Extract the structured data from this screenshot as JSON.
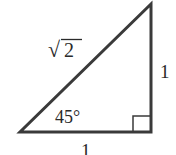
{
  "diagram": {
    "type": "right-triangle",
    "stroke_color": "#3a3a3a",
    "vertices": {
      "left": [
        20,
        132
      ],
      "right_angle": [
        151,
        132
      ],
      "top": [
        151,
        4
      ]
    },
    "labels": {
      "hypotenuse": "2",
      "hypotenuse_radical": "√",
      "vertical_leg": "1",
      "horizontal_leg": "1",
      "angle": "45°"
    },
    "right_angle_marker": true
  }
}
